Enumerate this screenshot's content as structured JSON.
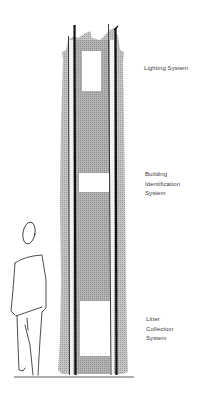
{
  "diagram": {
    "colors": {
      "pole_fill": "#b9b9b9",
      "pole_inner_fill": "#a8a8a8",
      "outline": "#111111",
      "text": "#3a3a3a",
      "background": "#ffffff"
    },
    "labels": [
      {
        "id": "lighting",
        "text": "Lighting System"
      },
      {
        "id": "building",
        "text": "Building\nIdentification\nSystem"
      },
      {
        "id": "litter",
        "text": "Litter\nCollection\nSystem"
      }
    ],
    "figure": {
      "name": "human-silhouette-sketch"
    }
  }
}
